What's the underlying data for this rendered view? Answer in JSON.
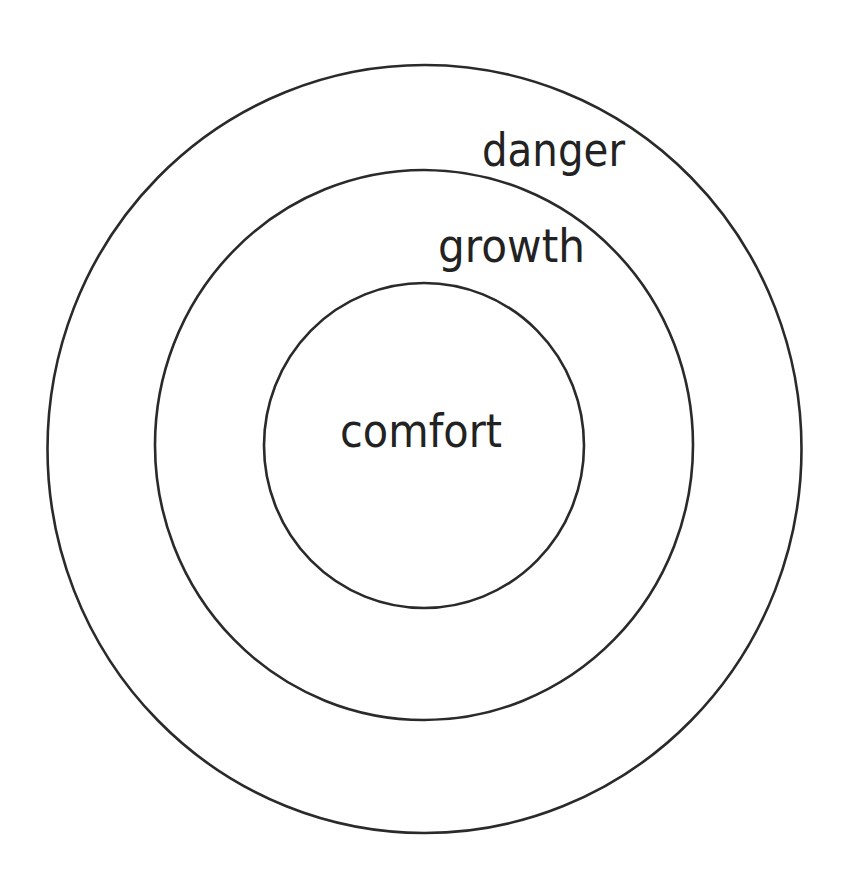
{
  "diagram": {
    "type": "concentric-zones",
    "stroke_color": "#2a2a2a",
    "text_color": "#222222",
    "background": "#ffffff",
    "zones": [
      {
        "label": "danger",
        "level": "outer"
      },
      {
        "label": "growth",
        "level": "middle"
      },
      {
        "label": "comfort",
        "level": "inner"
      }
    ]
  }
}
